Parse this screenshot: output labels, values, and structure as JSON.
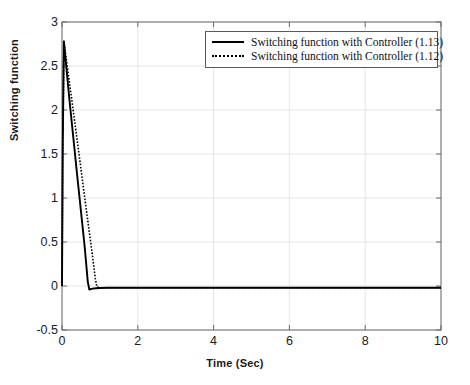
{
  "chart_data": {
    "type": "line",
    "title": "",
    "xlabel": "Time (Sec)",
    "ylabel": "Switching function",
    "xlim": [
      0,
      10
    ],
    "ylim": [
      -0.5,
      3
    ],
    "xticks": [
      0,
      2,
      4,
      6,
      8,
      10
    ],
    "yticks": [
      -0.5,
      0,
      0.5,
      1,
      1.5,
      2,
      2.5,
      3
    ],
    "xtick_labels": [
      "0",
      "2",
      "4",
      "6",
      "8",
      "10"
    ],
    "ytick_labels": [
      "-0.5",
      "0",
      "0.5",
      "1",
      "1.5",
      "2",
      "2.5",
      "3"
    ],
    "grid": true,
    "legend_position": "top-right",
    "series": [
      {
        "name": "Switching function with Controller (1.13)",
        "style": "solid",
        "color": "#000000",
        "x": [
          0,
          0.02,
          0.05,
          0.1,
          0.2,
          0.3,
          0.4,
          0.5,
          0.6,
          0.68,
          0.72,
          0.8,
          0.9,
          1.0,
          1.2,
          1.5,
          2.0,
          3.0,
          4.0,
          5.0,
          6.0,
          7.0,
          8.0,
          9.0,
          10.0
        ],
        "y": [
          0,
          1.6,
          2.78,
          2.55,
          2.1,
          1.68,
          1.26,
          0.85,
          0.44,
          0.05,
          -0.04,
          -0.03,
          -0.025,
          -0.022,
          -0.02,
          -0.02,
          -0.02,
          -0.02,
          -0.02,
          -0.02,
          -0.02,
          -0.02,
          -0.02,
          -0.02,
          -0.02
        ]
      },
      {
        "name": "Switching function with Controller (1.12)",
        "style": "dotted",
        "color": "#000000",
        "x": [
          0,
          0.02,
          0.05,
          0.1,
          0.2,
          0.3,
          0.4,
          0.5,
          0.6,
          0.7,
          0.8,
          0.88,
          0.92,
          1.0,
          1.2,
          1.5,
          2.0,
          3.0,
          4.0,
          5.0,
          6.0,
          7.0,
          8.0,
          9.0,
          10.0
        ],
        "y": [
          0,
          1.6,
          2.78,
          2.62,
          2.3,
          1.98,
          1.66,
          1.33,
          1.0,
          0.68,
          0.36,
          0.08,
          -0.01,
          -0.02,
          -0.02,
          -0.02,
          -0.02,
          -0.02,
          -0.02,
          -0.02,
          -0.02,
          -0.02,
          -0.02,
          -0.02,
          -0.02
        ]
      }
    ]
  },
  "axes": {
    "plot_left": 62,
    "plot_right": 441,
    "plot_top": 22,
    "plot_bottom": 330,
    "grid_color": "#e6e6e6",
    "axis_color": "#6b6b6b"
  },
  "legend": {
    "entries": [
      {
        "label": "Switching function with Controller (1.13)",
        "style": "solid"
      },
      {
        "label": "Switching function with Controller (1.12)",
        "style": "dotted"
      }
    ]
  }
}
